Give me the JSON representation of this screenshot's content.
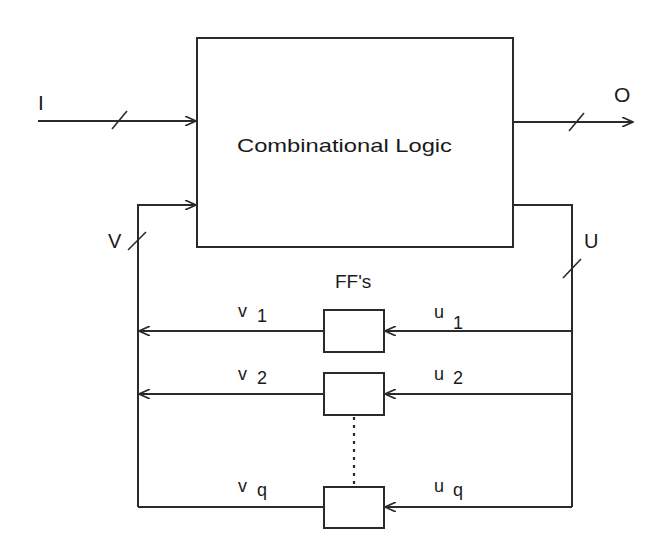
{
  "diagram": {
    "type": "sequential-circuit-block-diagram",
    "colors": {
      "stroke": "#2a2a2a",
      "text": "#1a1a1a",
      "background": "#ffffff"
    },
    "combinational_block": {
      "label": "Combinational Logic"
    },
    "input": {
      "label": "I"
    },
    "output": {
      "label": "O"
    },
    "feedback_in_bus": {
      "label": "V"
    },
    "feedback_out_bus": {
      "label": "U"
    },
    "ff_group": {
      "label": "FF's"
    },
    "rows": [
      {
        "v": "v",
        "v_sub": "1",
        "u": "u",
        "u_sub": "1"
      },
      {
        "v": "v",
        "v_sub": "2",
        "u": "u",
        "u_sub": "2"
      },
      {
        "v": "v",
        "v_sub": "q",
        "u": "u",
        "u_sub": "q"
      }
    ]
  }
}
